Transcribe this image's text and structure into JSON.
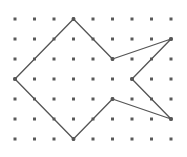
{
  "diagram": {
    "type": "dot-grid-polygon",
    "grid": {
      "columns": 9,
      "rows": 7,
      "origin_x": 15,
      "origin_y": 19,
      "spacing_x": 19.5,
      "spacing_y": 20,
      "dot_radius": 1.5,
      "dot_color": "#5a5a5a"
    },
    "polygon": {
      "stroke_color": "#555555",
      "stroke_width": 1.3,
      "vertex_radius": 2,
      "vertices": [
        {
          "col": 3,
          "row": 0
        },
        {
          "col": 5,
          "row": 2
        },
        {
          "col": 8,
          "row": 1
        },
        {
          "col": 6,
          "row": 3
        },
        {
          "col": 8,
          "row": 5
        },
        {
          "col": 5,
          "row": 4
        },
        {
          "col": 3,
          "row": 6
        },
        {
          "col": 0,
          "row": 3
        }
      ]
    }
  }
}
